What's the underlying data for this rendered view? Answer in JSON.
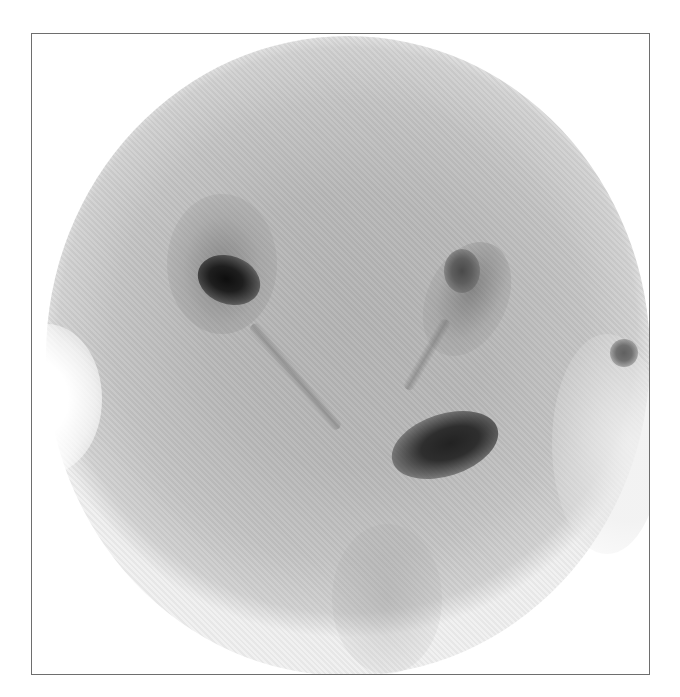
{
  "image": {
    "type": "nuclear-medicine-scintigraphy",
    "description": "Circular gamma camera scan with two renal uptake regions, ureters and bladder activity",
    "frame": {
      "border_color": "#6e6e6e",
      "background": "#ffffff"
    },
    "field_of_view": {
      "shape": "circle",
      "fill_color": "#b8b8b8"
    },
    "features": [
      {
        "name": "left-kidney",
        "intensity": "high",
        "color": "#0e0e0e"
      },
      {
        "name": "right-kidney",
        "intensity": "medium",
        "color": "#4a4a4a"
      },
      {
        "name": "left-ureter",
        "intensity": "low",
        "color": "#787878"
      },
      {
        "name": "right-ureter",
        "intensity": "low",
        "color": "#787878"
      },
      {
        "name": "bladder",
        "intensity": "high",
        "color": "#222222"
      },
      {
        "name": "marker-hotspot",
        "intensity": "medium",
        "color": "#606060"
      }
    ]
  }
}
